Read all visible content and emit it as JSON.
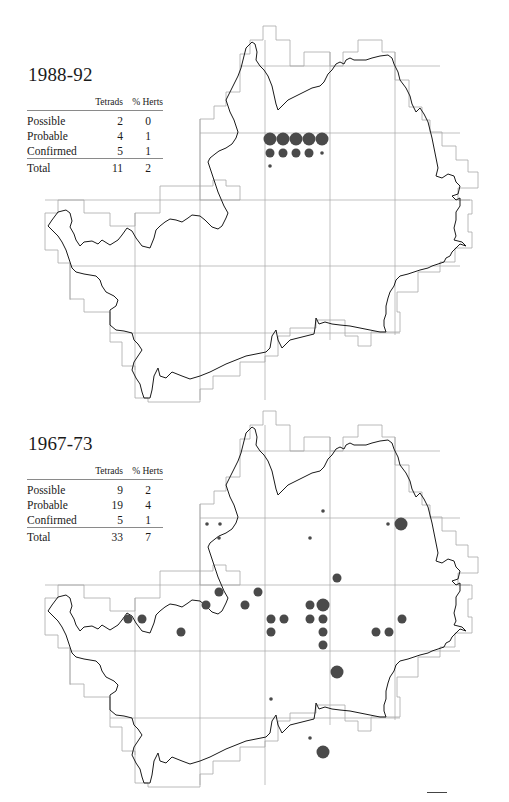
{
  "maps": [
    {
      "title": "1988-92",
      "table": {
        "headers": [
          "",
          "Tetrads",
          "% Herts"
        ],
        "rows": [
          {
            "label": "Possible",
            "tetrads": "2",
            "pct": "0"
          },
          {
            "label": "Probable",
            "tetrads": "4",
            "pct": "1"
          },
          {
            "label": "Confirmed",
            "tetrads": "5",
            "pct": "1"
          }
        ],
        "total": {
          "label": "Total",
          "tetrads": "11",
          "pct": "2"
        }
      },
      "dots": [
        {
          "x": 270,
          "y": 139,
          "size": "large"
        },
        {
          "x": 283,
          "y": 139,
          "size": "large"
        },
        {
          "x": 296,
          "y": 139,
          "size": "large"
        },
        {
          "x": 309,
          "y": 139,
          "size": "large"
        },
        {
          "x": 322,
          "y": 139,
          "size": "large"
        },
        {
          "x": 270,
          "y": 153,
          "size": "medium"
        },
        {
          "x": 283,
          "y": 153,
          "size": "medium"
        },
        {
          "x": 296,
          "y": 153,
          "size": "medium"
        },
        {
          "x": 309,
          "y": 153,
          "size": "medium"
        },
        {
          "x": 322,
          "y": 153,
          "size": "small"
        },
        {
          "x": 270,
          "y": 166,
          "size": "small"
        }
      ]
    },
    {
      "title": "1967-73",
      "table": {
        "headers": [
          "",
          "Tetrads",
          "% Herts"
        ],
        "rows": [
          {
            "label": "Possible",
            "tetrads": "9",
            "pct": "2"
          },
          {
            "label": "Probable",
            "tetrads": "19",
            "pct": "4"
          },
          {
            "label": "Confirmed",
            "tetrads": "5",
            "pct": "1"
          }
        ],
        "total": {
          "label": "Total",
          "tetrads": "33",
          "pct": "7"
        }
      },
      "dots": [
        {
          "x": 207,
          "y": 524,
          "size": "small"
        },
        {
          "x": 220,
          "y": 524,
          "size": "small"
        },
        {
          "x": 219,
          "y": 538,
          "size": "small"
        },
        {
          "x": 323,
          "y": 511,
          "size": "small"
        },
        {
          "x": 310,
          "y": 538,
          "size": "small"
        },
        {
          "x": 388,
          "y": 524,
          "size": "small"
        },
        {
          "x": 401,
          "y": 524,
          "size": "large"
        },
        {
          "x": 337,
          "y": 578,
          "size": "medium"
        },
        {
          "x": 219,
          "y": 592,
          "size": "medium"
        },
        {
          "x": 258,
          "y": 592,
          "size": "medium"
        },
        {
          "x": 206,
          "y": 605,
          "size": "medium"
        },
        {
          "x": 245,
          "y": 605,
          "size": "medium"
        },
        {
          "x": 310,
          "y": 605,
          "size": "medium"
        },
        {
          "x": 323,
          "y": 605,
          "size": "large"
        },
        {
          "x": 128,
          "y": 619,
          "size": "medium"
        },
        {
          "x": 142,
          "y": 619,
          "size": "medium"
        },
        {
          "x": 271,
          "y": 619,
          "size": "medium"
        },
        {
          "x": 284,
          "y": 619,
          "size": "medium"
        },
        {
          "x": 310,
          "y": 619,
          "size": "medium"
        },
        {
          "x": 323,
          "y": 619,
          "size": "medium"
        },
        {
          "x": 402,
          "y": 619,
          "size": "medium"
        },
        {
          "x": 181,
          "y": 632,
          "size": "medium"
        },
        {
          "x": 271,
          "y": 632,
          "size": "medium"
        },
        {
          "x": 323,
          "y": 632,
          "size": "medium"
        },
        {
          "x": 376,
          "y": 632,
          "size": "medium"
        },
        {
          "x": 389,
          "y": 632,
          "size": "medium"
        },
        {
          "x": 323,
          "y": 645,
          "size": "medium"
        },
        {
          "x": 337,
          "y": 672,
          "size": "large"
        },
        {
          "x": 271,
          "y": 699,
          "size": "small"
        },
        {
          "x": 310,
          "y": 738,
          "size": "small"
        },
        {
          "x": 323,
          "y": 752,
          "size": "large"
        }
      ]
    }
  ],
  "legend": {
    "dot_color": "#4a4a4a",
    "outline_color": "#1a1a1a",
    "grid_color": "#a8a8a8",
    "sizes": {
      "small": 1.8,
      "medium": 4.5,
      "large": 6.5
    }
  }
}
